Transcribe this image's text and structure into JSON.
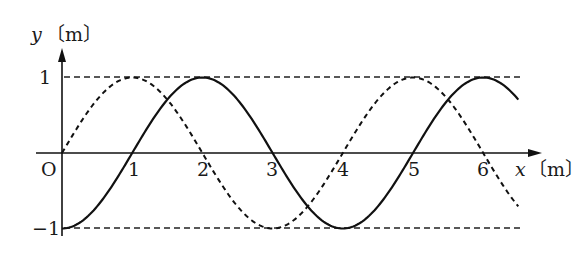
{
  "chart_data": {
    "type": "line",
    "title": "",
    "xlabel": "x〔m〕",
    "ylabel": "y〔m〕",
    "x_ticks": [
      "1",
      "2",
      "3",
      "4",
      "5",
      "6"
    ],
    "y_ticks": [
      "1",
      "-1"
    ],
    "origin_label": "O",
    "xlim": [
      0,
      6.5
    ],
    "ylim": [
      -1,
      1
    ],
    "grid": false,
    "reference_lines": [
      {
        "y": 1,
        "style": "dashed"
      },
      {
        "y": -1,
        "style": "dashed"
      }
    ],
    "series": [
      {
        "name": "solid wave",
        "style": "solid",
        "formula": "y = -cos(pi*x/2)",
        "x": [
          0,
          1,
          2,
          3,
          4,
          5,
          6,
          6.5
        ],
        "values": [
          -1,
          0,
          1,
          0,
          -1,
          0,
          1,
          0.71
        ]
      },
      {
        "name": "dashed wave",
        "style": "dashed",
        "formula": "y = sin(pi*x/2)",
        "x": [
          0,
          1,
          2,
          3,
          4,
          5,
          6,
          6.5
        ],
        "values": [
          0,
          1,
          0,
          -1,
          0,
          1,
          0,
          -0.71
        ]
      }
    ]
  },
  "labels": {
    "y_axis_var": "y",
    "y_axis_unit": "〔m〕",
    "x_axis_var": "x",
    "x_axis_unit": "〔m〕",
    "origin": "O",
    "y_top": "1",
    "y_bottom": "−1",
    "x1": "1",
    "x2": "2",
    "x3": "3",
    "x4": "4",
    "x5": "5",
    "x6": "6"
  }
}
